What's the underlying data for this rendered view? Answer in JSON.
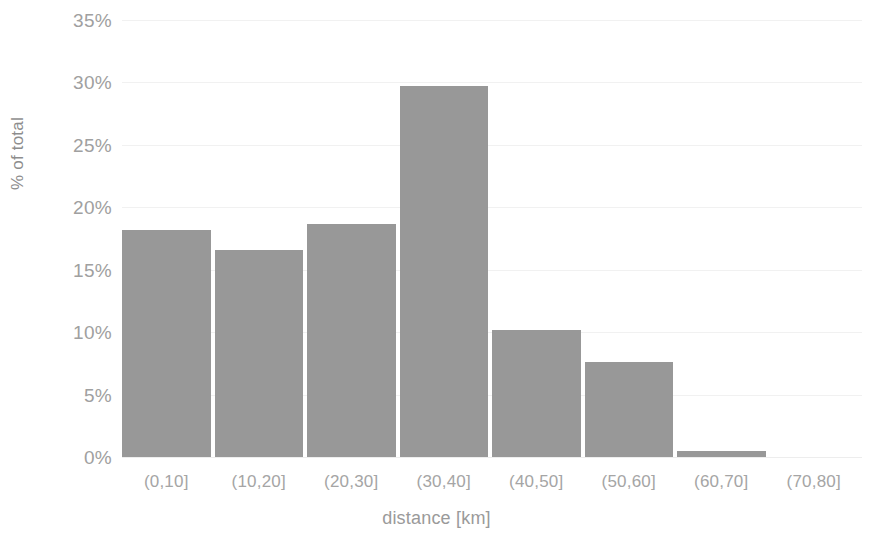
{
  "chart_data": {
    "type": "bar",
    "title": "",
    "subtitle": "",
    "xlabel": "distance [km]",
    "ylabel": "% of total",
    "categories": [
      "(0,10]",
      "(10,20]",
      "(20,30]",
      "(30,40]",
      "(40,50]",
      "(50,60]",
      "(60,70]",
      "(70,80]"
    ],
    "values": [
      18.2,
      16.6,
      18.7,
      29.7,
      10.2,
      7.6,
      0.5,
      0.0
    ],
    "value_labels": [
      "18.2%",
      "16.6%",
      "18.7%",
      "29.7%",
      "10.2%",
      "7.6%",
      "0.5%",
      "0%"
    ],
    "ylim": [
      0,
      35
    ],
    "y_ticks": [
      0,
      5,
      10,
      15,
      20,
      25,
      30,
      35
    ],
    "y_tick_labels": [
      "0%",
      "5%",
      "10%",
      "15%",
      "20%",
      "25%",
      "30%",
      "35%"
    ],
    "grid": true,
    "grid_axis": "y",
    "legend": null,
    "legend_position": "none",
    "bar_color": "#989898",
    "gridline_color": "#f1f1f1",
    "background_color": "#ffffff",
    "tick_label_color": "#a0a0a0",
    "axis_title_color": "#9a9a9a",
    "annotations": []
  }
}
